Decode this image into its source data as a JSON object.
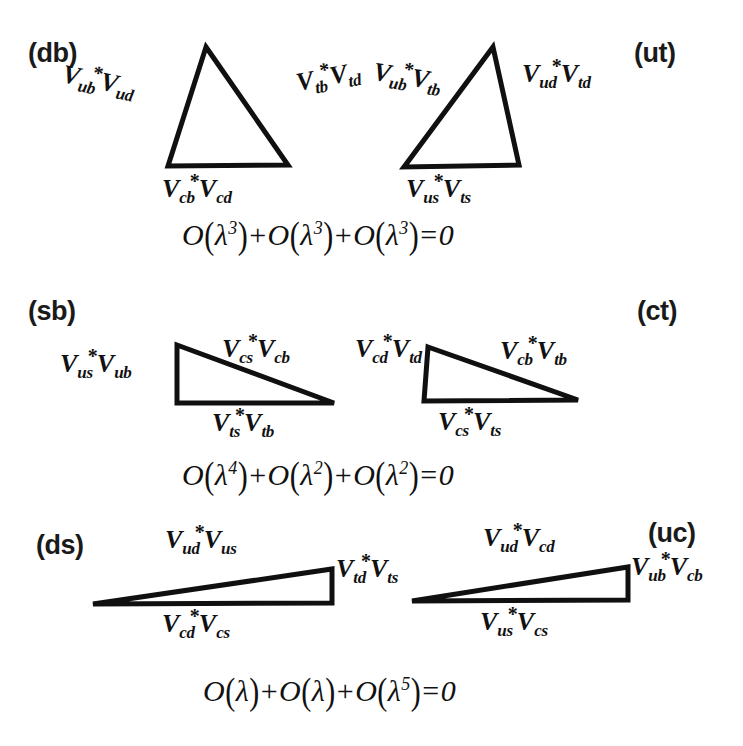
{
  "figure": {
    "title_visible": false,
    "background": "#ffffff",
    "ink": "#111111",
    "rows": [
      {
        "id": "row-1",
        "left_tag": "(db)",
        "right_tag": "(ut)",
        "triangles": [
          {
            "id": "db",
            "shape": "tall-triangle",
            "labels": {
              "left": {
                "v1": "V",
                "s1": "ub",
                "star": true,
                "v2": "V",
                "s2": "ud"
              },
              "right": {
                "v1": "V",
                "s1": "tb",
                "star": true,
                "v2": "V",
                "s2": "td"
              },
              "base": {
                "v1": "V",
                "s1": "cb",
                "star": true,
                "v2": "V",
                "s2": "cd"
              }
            }
          },
          {
            "id": "ut",
            "shape": "tall-triangle",
            "labels": {
              "left": {
                "v1": "V",
                "s1": "ub",
                "star": true,
                "v2": "V",
                "s2": "tb"
              },
              "right": {
                "v1": "V",
                "s1": "ud",
                "star": true,
                "v2": "V",
                "s2": "td"
              },
              "base": {
                "v1": "V",
                "s1": "us",
                "star": true,
                "v2": "V",
                "s2": "ts"
              }
            }
          }
        ],
        "equation": {
          "terms": [
            "λ",
            "λ",
            "λ"
          ],
          "exponents": [
            "3",
            "3",
            "3"
          ],
          "result": "0",
          "text": "O(λ³)+O(λ³)+O(λ³)=0"
        }
      },
      {
        "id": "row-2",
        "left_tag": "(sb)",
        "right_tag": "(ct)",
        "triangles": [
          {
            "id": "sb",
            "shape": "flat-right-triangle",
            "labels": {
              "left": {
                "v1": "V",
                "s1": "us",
                "star": true,
                "v2": "V",
                "s2": "ub"
              },
              "hyp": {
                "v1": "V",
                "s1": "cs",
                "star": true,
                "v2": "V",
                "s2": "cb"
              },
              "base": {
                "v1": "V",
                "s1": "ts",
                "star": true,
                "v2": "V",
                "s2": "tb"
              }
            }
          },
          {
            "id": "ct",
            "shape": "flat-right-triangle",
            "labels": {
              "left": {
                "v1": "V",
                "s1": "cd",
                "star": true,
                "v2": "V",
                "s2": "td"
              },
              "hyp": {
                "v1": "V",
                "s1": "cb",
                "star": true,
                "v2": "V",
                "s2": "tb"
              },
              "base": {
                "v1": "V",
                "s1": "cs",
                "star": true,
                "v2": "V",
                "s2": "ts"
              }
            }
          }
        ],
        "equation": {
          "terms": [
            "λ",
            "λ",
            "λ"
          ],
          "exponents": [
            "4",
            "2",
            "2"
          ],
          "result": "0",
          "text": "O(λ⁴)+O(λ²)+O(λ²)=0"
        }
      },
      {
        "id": "row-3",
        "left_tag": "(ds)",
        "right_tag": "(uc)",
        "triangles": [
          {
            "id": "ds",
            "shape": "very-flat-triangle",
            "labels": {
              "top": {
                "v1": "V",
                "s1": "ud",
                "star": true,
                "v2": "V",
                "s2": "us"
              },
              "right": {
                "v1": "V",
                "s1": "td",
                "star": true,
                "v2": "V",
                "s2": "ts"
              },
              "base": {
                "v1": "V",
                "s1": "cd",
                "star": true,
                "v2": "V",
                "s2": "cs"
              }
            }
          },
          {
            "id": "uc",
            "shape": "very-flat-triangle",
            "labels": {
              "top": {
                "v1": "V",
                "s1": "ud",
                "star": true,
                "v2": "V",
                "s2": "cd"
              },
              "right": {
                "v1": "V",
                "s1": "ub",
                "star": true,
                "v2": "V",
                "s2": "cb"
              },
              "base": {
                "v1": "V",
                "s1": "us",
                "star": true,
                "v2": "V",
                "s2": "cs"
              }
            }
          }
        ],
        "equation": {
          "terms": [
            "λ",
            "λ",
            "λ"
          ],
          "exponents": [
            "",
            "",
            "5"
          ],
          "result": "0",
          "text": "O(λ)+O(λ)+O(λ⁵)=0"
        }
      }
    ],
    "symbols": {
      "star": "*",
      "lambda": "λ",
      "bigO": "O",
      "plus": "+",
      "equals": "="
    }
  }
}
